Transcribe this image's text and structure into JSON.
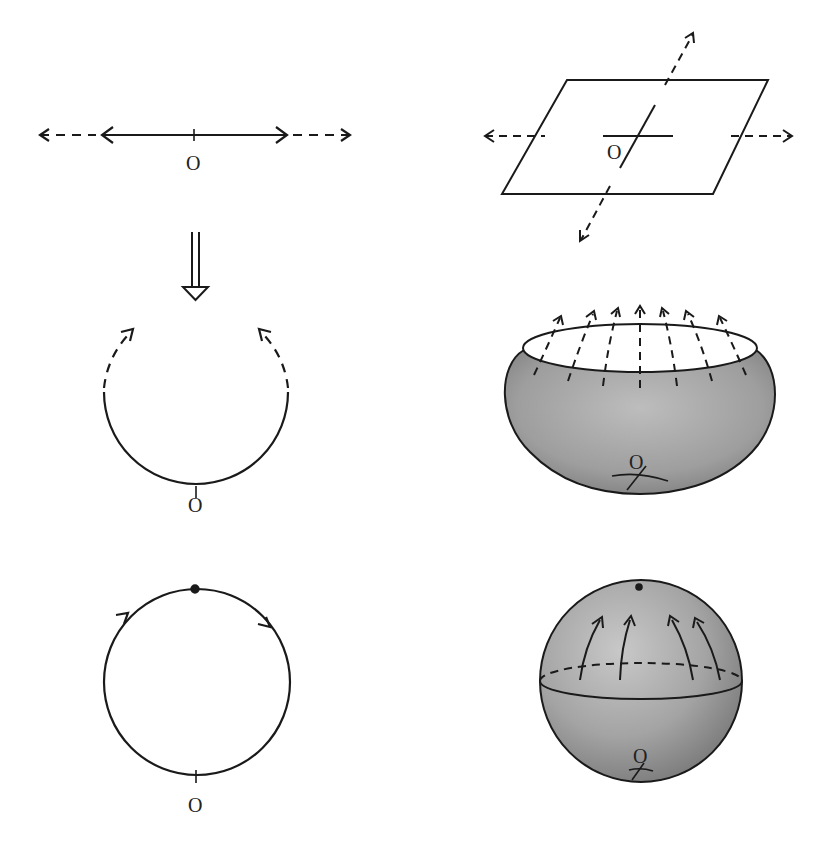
{
  "figure": {
    "colors": {
      "stroke": "#1a1a1a",
      "shade_light": "#c4c4c4",
      "shade_mid": "#a6a6a6",
      "shade_dark": "#7d7d7d"
    },
    "panels": {
      "line": {
        "origin_label": "O"
      },
      "plane": {
        "origin_label": "O"
      },
      "open_circle": {
        "origin_label": "O"
      },
      "bowl": {
        "origin_label": "O"
      },
      "circle": {
        "origin_label": "O"
      },
      "sphere": {
        "origin_label": "O"
      }
    },
    "implies_arrow": "double-arrow-down"
  }
}
